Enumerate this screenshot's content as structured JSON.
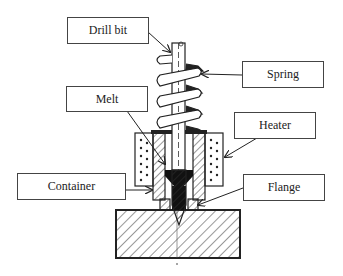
{
  "diagram": {
    "type": "mechanical cross-section",
    "labels": [
      {
        "id": "drill-bit",
        "text": "Drill bit"
      },
      {
        "id": "spring",
        "text": "Spring"
      },
      {
        "id": "melt",
        "text": "Melt"
      },
      {
        "id": "heater",
        "text": "Heater"
      },
      {
        "id": "container",
        "text": "Container"
      },
      {
        "id": "flange",
        "text": "Flange"
      }
    ]
  }
}
